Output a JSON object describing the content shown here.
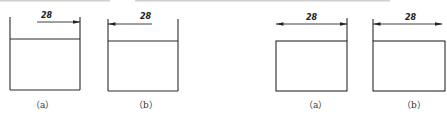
{
  "figures": [
    {
      "id": "fig1a",
      "caption": "（a）",
      "dimension_label": "28",
      "arrow_direction": "right",
      "rect": {
        "x1": 10,
        "x2": 80,
        "top": 39,
        "bottom": 90
      },
      "extension_top": 17,
      "dim_line": {
        "y": 22,
        "x1": 37,
        "x2": 80
      }
    },
    {
      "id": "fig1b",
      "caption": "（b）",
      "dimension_label": "28",
      "arrow_direction": "left",
      "rect": {
        "x1": 108,
        "x2": 178,
        "top": 41,
        "bottom": 91
      },
      "extension_top": 19,
      "dim_line": {
        "y": 24,
        "x1": 108,
        "x2": 152
      }
    },
    {
      "id": "fig2a",
      "caption": "（a）",
      "dimension_label": "28",
      "arrow_direction": "both",
      "rect": {
        "x1": 276,
        "x2": 347,
        "top": 41,
        "bottom": 91
      },
      "extension_top": 18,
      "dim_line": {
        "y": 24,
        "x1": 276,
        "x2": 347
      }
    },
    {
      "id": "fig2b",
      "caption": "（b）",
      "dimension_label": "28",
      "arrow_direction": "both",
      "rect": {
        "x1": 373,
        "x2": 445,
        "top": 41,
        "bottom": 91
      },
      "extension_top": 19,
      "dim_line": {
        "y": 24,
        "x1": 373,
        "x2": 442
      }
    }
  ]
}
